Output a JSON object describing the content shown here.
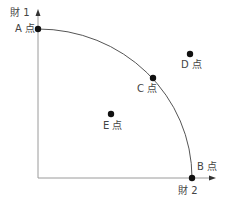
{
  "diagram": {
    "type": "production-possibility-frontier",
    "y_axis_label": "財 1",
    "x_axis_label": "財 2",
    "points": [
      {
        "id": "A",
        "label": "A 点",
        "x": 38,
        "y": 29
      },
      {
        "id": "B",
        "label": "B 点",
        "x": 192,
        "y": 178
      },
      {
        "id": "C",
        "label": "C 点",
        "x": 153,
        "y": 78
      },
      {
        "id": "D",
        "label": "D 点",
        "x": 190,
        "y": 54
      },
      {
        "id": "E",
        "label": "E 点",
        "x": 111,
        "y": 114
      }
    ],
    "colors": {
      "axis": "#9a9a9a",
      "curve": "#555555",
      "point": "#111111",
      "text": "#444444"
    }
  }
}
